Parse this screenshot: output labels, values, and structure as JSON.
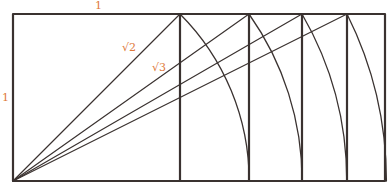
{
  "diagram": {
    "colors": {
      "line": "#3a3230",
      "label": "#e0793a",
      "background": "#ffffff"
    },
    "geometry": {
      "origin": [
        13,
        181
      ],
      "unit_px": 167,
      "rect_right": 385,
      "rect_top": 14
    },
    "verticals": [
      {
        "name": "sqrt1",
        "x": 180
      },
      {
        "name": "sqrt2",
        "x": 249
      },
      {
        "name": "sqrt3",
        "x": 302
      },
      {
        "name": "sqrt4",
        "x": 347
      },
      {
        "name": "sqrt5",
        "x": 385
      }
    ],
    "labels": {
      "top_side": "1",
      "left_side": "1",
      "diag_sqrt2": "√2",
      "diag_sqrt3": "√3"
    }
  }
}
